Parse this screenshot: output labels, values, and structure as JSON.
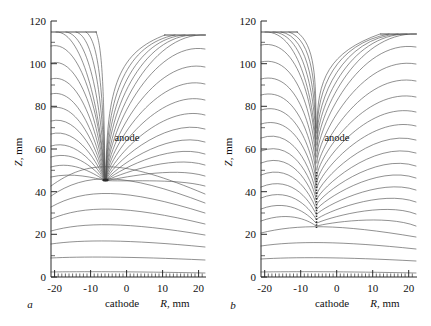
{
  "figure": {
    "panels": [
      {
        "letter": "a",
        "anode_label": "anode",
        "cathode_label": "cathode",
        "x_axis_title_italic": "R",
        "x_axis_title_rest": ", mm",
        "y_axis_title_italic": "Z",
        "y_axis_title_rest": ", mm",
        "xticks": [
          "-20",
          "-10",
          "0",
          "10",
          "20"
        ],
        "yticks": [
          "0",
          "20",
          "40",
          "60",
          "80",
          "100",
          "120"
        ]
      },
      {
        "letter": "b",
        "anode_label": "anode",
        "cathode_label": "cathode",
        "x_axis_title_italic": "R",
        "x_axis_title_rest": ", mm",
        "y_axis_title_italic": "Z",
        "y_axis_title_rest": ", mm",
        "xticks": [
          "-20",
          "-10",
          "0",
          "10",
          "20"
        ],
        "yticks": [
          "0",
          "20",
          "40",
          "60",
          "80",
          "100",
          "120"
        ]
      }
    ]
  },
  "colors": {
    "background": "#ffffff",
    "axis": "#2b2b2b",
    "fieldline": "#555555",
    "electrode": "#3a3a3a",
    "text": "#111111"
  },
  "chart_data": {
    "type": "line",
    "panel_count": 2,
    "panels": [
      {
        "letter": "a",
        "xlabel": "R, mm",
        "ylabel": "Z, mm",
        "xlim": [
          -21.5,
          21.5
        ],
        "ylim": [
          0,
          120
        ],
        "xticks": [
          -20,
          -10,
          0,
          10,
          20
        ],
        "yticks": [
          0,
          20,
          40,
          60,
          80,
          100,
          120
        ],
        "xtick_minor_step": 1,
        "grid": false,
        "legend": false,
        "annotations": [
          {
            "text": "anode",
            "x": 0.0,
            "y": 68.0
          },
          {
            "text": "cathode",
            "x": -3.5,
            "y": -9.0
          }
        ],
        "electrodes": [
          {
            "name": "cathode-plane",
            "type": "horizontal-segment",
            "z": 0.0,
            "r_from": -21.5,
            "r_to": 21.5
          },
          {
            "name": "upper-left-plate",
            "type": "horizontal-segment",
            "z": 114.0,
            "r_from": -19.5,
            "r_to": -8.0
          },
          {
            "name": "upper-right-plate",
            "type": "horizontal-segment",
            "z": 113.0,
            "r_from": 12.5,
            "r_to": 21.5
          },
          {
            "name": "anode-tip",
            "type": "point",
            "r": 0.0,
            "z": 47.0
          }
        ],
        "series_description": "26 electric field lines, symmetric about R=0; lower lines are shallow arcs terminating on the cathode plane, upper lines converge on the anode tip at (0, 47) mm",
        "field_line_convergence_point": {
          "r": 0.0,
          "z": 47.0
        },
        "lowest_line_apex_z": 7.0,
        "line_apex_z_values": [
          7.0,
          14.5,
          22.5,
          29.5,
          35.5,
          40.5,
          44.0,
          46.0,
          47.0
        ],
        "n_lines_per_side": 13
      },
      {
        "letter": "b",
        "xlabel": "R, mm",
        "ylabel": "Z, mm",
        "xlim": [
          -21.5,
          21.5
        ],
        "ylim": [
          0,
          120
        ],
        "xticks": [
          -20,
          -10,
          0,
          10,
          20
        ],
        "yticks": [
          0,
          20,
          40,
          60,
          80,
          100,
          120
        ],
        "xtick_minor_step": 1,
        "grid": false,
        "legend": false,
        "annotations": [
          {
            "text": "anode",
            "x": 0.0,
            "y": 68.0
          },
          {
            "text": "cathode",
            "x": -3.5,
            "y": -9.0
          }
        ],
        "electrodes": [
          {
            "name": "cathode-plane",
            "type": "horizontal-segment",
            "z": 0.0,
            "r_from": -21.5,
            "r_to": 21.5
          },
          {
            "name": "upper-left-plate",
            "type": "horizontal-segment",
            "z": 114.0,
            "r_from": -19.5,
            "r_to": -8.0
          },
          {
            "name": "upper-right-plate",
            "type": "horizontal-segment",
            "z": 113.0,
            "r_from": 12.5,
            "r_to": 21.5
          },
          {
            "name": "anode-rod",
            "type": "vertical-segment",
            "r": 0.0,
            "z_from": 24.0,
            "z_to": 50.0
          }
        ],
        "series_description": "26 electric field lines, symmetric about R=0; lines converge onto a thin vertical rod anode spanning Z = 24 to 50 mm at R = 0",
        "field_line_convergence_segment": {
          "r": 0.0,
          "z_from": 24.0,
          "z_to": 50.0
        },
        "lowest_line_apex_z": 7.0,
        "line_apex_z_values": [
          7.0,
          14.0,
          21.5,
          24.0,
          28.0,
          32.0,
          36.0,
          40.0,
          44.0,
          48.0,
          50.0
        ],
        "n_lines_per_side": 13
      }
    ]
  }
}
